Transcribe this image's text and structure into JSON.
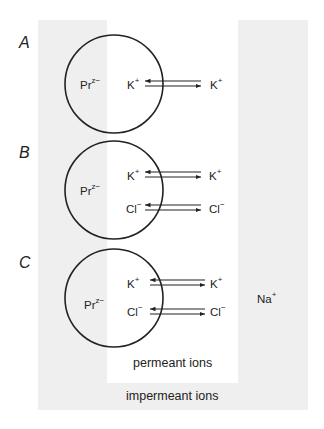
{
  "diagram": {
    "regions": {
      "permeant_label": "permeant ions",
      "impermeant_label": "impermeant ions",
      "impermeant_ion": {
        "base": "Na",
        "charge": "+"
      }
    },
    "colors": {
      "impermeant_region": "#efefef",
      "permeant_region": "#ffffff",
      "stroke": "#222222"
    },
    "panels": [
      {
        "label": "A",
        "protein": {
          "base": "Pr",
          "charge": "z−"
        },
        "exchanges": [
          {
            "inside": {
              "base": "K",
              "charge": "+"
            },
            "outside": {
              "base": "K",
              "charge": "+"
            }
          }
        ]
      },
      {
        "label": "B",
        "protein": {
          "base": "Pr",
          "charge": "z−"
        },
        "exchanges": [
          {
            "inside": {
              "base": "K",
              "charge": "+"
            },
            "outside": {
              "base": "K",
              "charge": "+"
            }
          },
          {
            "inside": {
              "base": "Cl",
              "charge": "−"
            },
            "outside": {
              "base": "Cl",
              "charge": "−"
            }
          }
        ]
      },
      {
        "label": "C",
        "protein": {
          "base": "Pr",
          "charge": "z−"
        },
        "exchanges": [
          {
            "inside": {
              "base": "K",
              "charge": "+"
            },
            "outside": {
              "base": "K",
              "charge": "+"
            }
          },
          {
            "inside": {
              "base": "Cl",
              "charge": "−"
            },
            "outside": {
              "base": "Cl",
              "charge": "−"
            }
          }
        ]
      }
    ]
  }
}
